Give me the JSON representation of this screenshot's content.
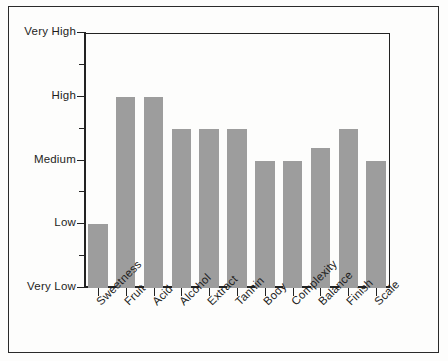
{
  "chart_data": {
    "type": "bar",
    "title": "",
    "subtitle": "",
    "xlabel": "",
    "ylabel": "",
    "grid": false,
    "legend": false,
    "bar_color": "#9d9d9d",
    "axis_color": "#222222",
    "background_color": "#fdfdfc",
    "categories": [
      "Sweetness",
      "Fruit",
      "Acid",
      "Alcohol",
      "Extract",
      "Tannin",
      "Body",
      "Complexity",
      "Balance",
      "Finish",
      "Scale"
    ],
    "values": [
      1.0,
      3.0,
      3.0,
      2.5,
      2.5,
      2.5,
      2.0,
      2.0,
      2.2,
      2.5,
      2.0
    ],
    "ylim": [
      0,
      4
    ],
    "ytick_values": [
      0,
      0.5,
      1,
      1.5,
      2,
      2.5,
      3,
      3.5,
      4
    ],
    "ytick_labels": [
      "Very Low",
      "",
      "Low",
      "",
      "Medium",
      "",
      "High",
      "",
      "Very High"
    ],
    "ytick_major": [
      {
        "value": 0,
        "label": "Very Low"
      },
      {
        "value": 1,
        "label": "Low"
      },
      {
        "value": 2,
        "label": "Medium"
      },
      {
        "value": 3,
        "label": "High"
      },
      {
        "value": 4,
        "label": "Very High"
      }
    ],
    "ytick_minor": [
      0.5,
      1.5,
      2.5,
      3.5
    ],
    "value_scale_note": "Category axis: Very Low=0, Low=1, Medium=2, High=3, Very High=4"
  }
}
